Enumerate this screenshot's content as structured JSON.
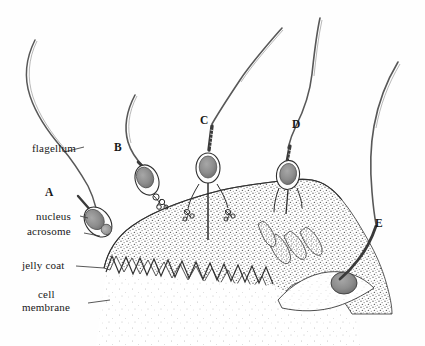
{
  "figure": {
    "type": "biological-illustration",
    "medium": "pen-and-ink stipple drawing",
    "background_color": "#ffffff",
    "ink_color": "#1a1a1a",
    "jelly_coat_color": "#9a9a9a",
    "cytoplasm_color": "#cfcfcf",
    "nucleus_color": "#8a8a8a"
  },
  "part_labels": [
    {
      "id": "flagellum",
      "text": "flagellum",
      "x": 36,
      "y": 142,
      "leader_to_x": 78,
      "leader_to_y": 150
    },
    {
      "id": "nucleus",
      "text": "nucleus",
      "x": 38,
      "y": 210,
      "leader_to_x": 92,
      "leader_to_y": 217
    },
    {
      "id": "acrosome",
      "text": "acrosome",
      "x": 30,
      "y": 225,
      "leader_to_x": 100,
      "leader_to_y": 234
    },
    {
      "id": "jelly-coat",
      "text": "jelly coat",
      "x": 24,
      "y": 262,
      "leader_to_x": 104,
      "leader_to_y": 268
    },
    {
      "id": "cell-membrane-1",
      "text": "cell",
      "x": 38,
      "y": 290,
      "leader_to_x": 0,
      "leader_to_y": 0
    },
    {
      "id": "cell-membrane-2",
      "text": "membrane",
      "x": 24,
      "y": 303,
      "leader_to_x": 106,
      "leader_to_y": 306
    }
  ],
  "stage_labels": [
    {
      "id": "A",
      "text": "A",
      "x": 45,
      "y": 188,
      "caption": "sperm approaching jelly coat, intact acrosome"
    },
    {
      "id": "B",
      "text": "B",
      "x": 114,
      "y": 143,
      "caption": "acrosomal vesicle discharging at jelly coat"
    },
    {
      "id": "C",
      "text": "C",
      "x": 200,
      "y": 116,
      "caption": "acrosomal process extended through jelly coat"
    },
    {
      "id": "D",
      "text": "D",
      "x": 292,
      "y": 119,
      "caption": "sperm bound to egg microvilli / fertilization cone"
    },
    {
      "id": "E",
      "text": "E",
      "x": 375,
      "y": 218,
      "caption": "sperm nucleus drawn into egg cytoplasm"
    }
  ],
  "sperm": [
    {
      "id": "A",
      "head_cx": 98,
      "head_cy": 222,
      "head_rx": 12,
      "head_ry": 16,
      "rotation": -38,
      "acrosome_reacted": false
    },
    {
      "id": "B",
      "head_cx": 147,
      "head_cy": 178,
      "head_rx": 11,
      "head_ry": 15,
      "rotation": -20,
      "acrosome_reacted": true
    },
    {
      "id": "C",
      "head_cx": 208,
      "head_cy": 168,
      "head_rx": 12,
      "head_ry": 15,
      "rotation": 0,
      "acrosome_reacted": true
    },
    {
      "id": "D",
      "head_cx": 288,
      "head_cy": 175,
      "head_rx": 11,
      "head_ry": 14,
      "rotation": 8,
      "acrosome_reacted": true
    },
    {
      "id": "E",
      "head_cx": 344,
      "head_cy": 283,
      "head_rx": 13,
      "head_ry": 11,
      "rotation": 0,
      "acrosome_reacted": true
    }
  ],
  "structures": {
    "jelly_coat": "large stippled gray mass occupying the lower-centre and right of the frame",
    "microvilli": "sawtooth crenulated border along the inner edge of the jelly coat",
    "egg_cytoplasm": "pale lightly-stippled region below the microvilli border",
    "fertilization_cone": "pale funnel at stage E drawing the sperm nucleus inward"
  }
}
